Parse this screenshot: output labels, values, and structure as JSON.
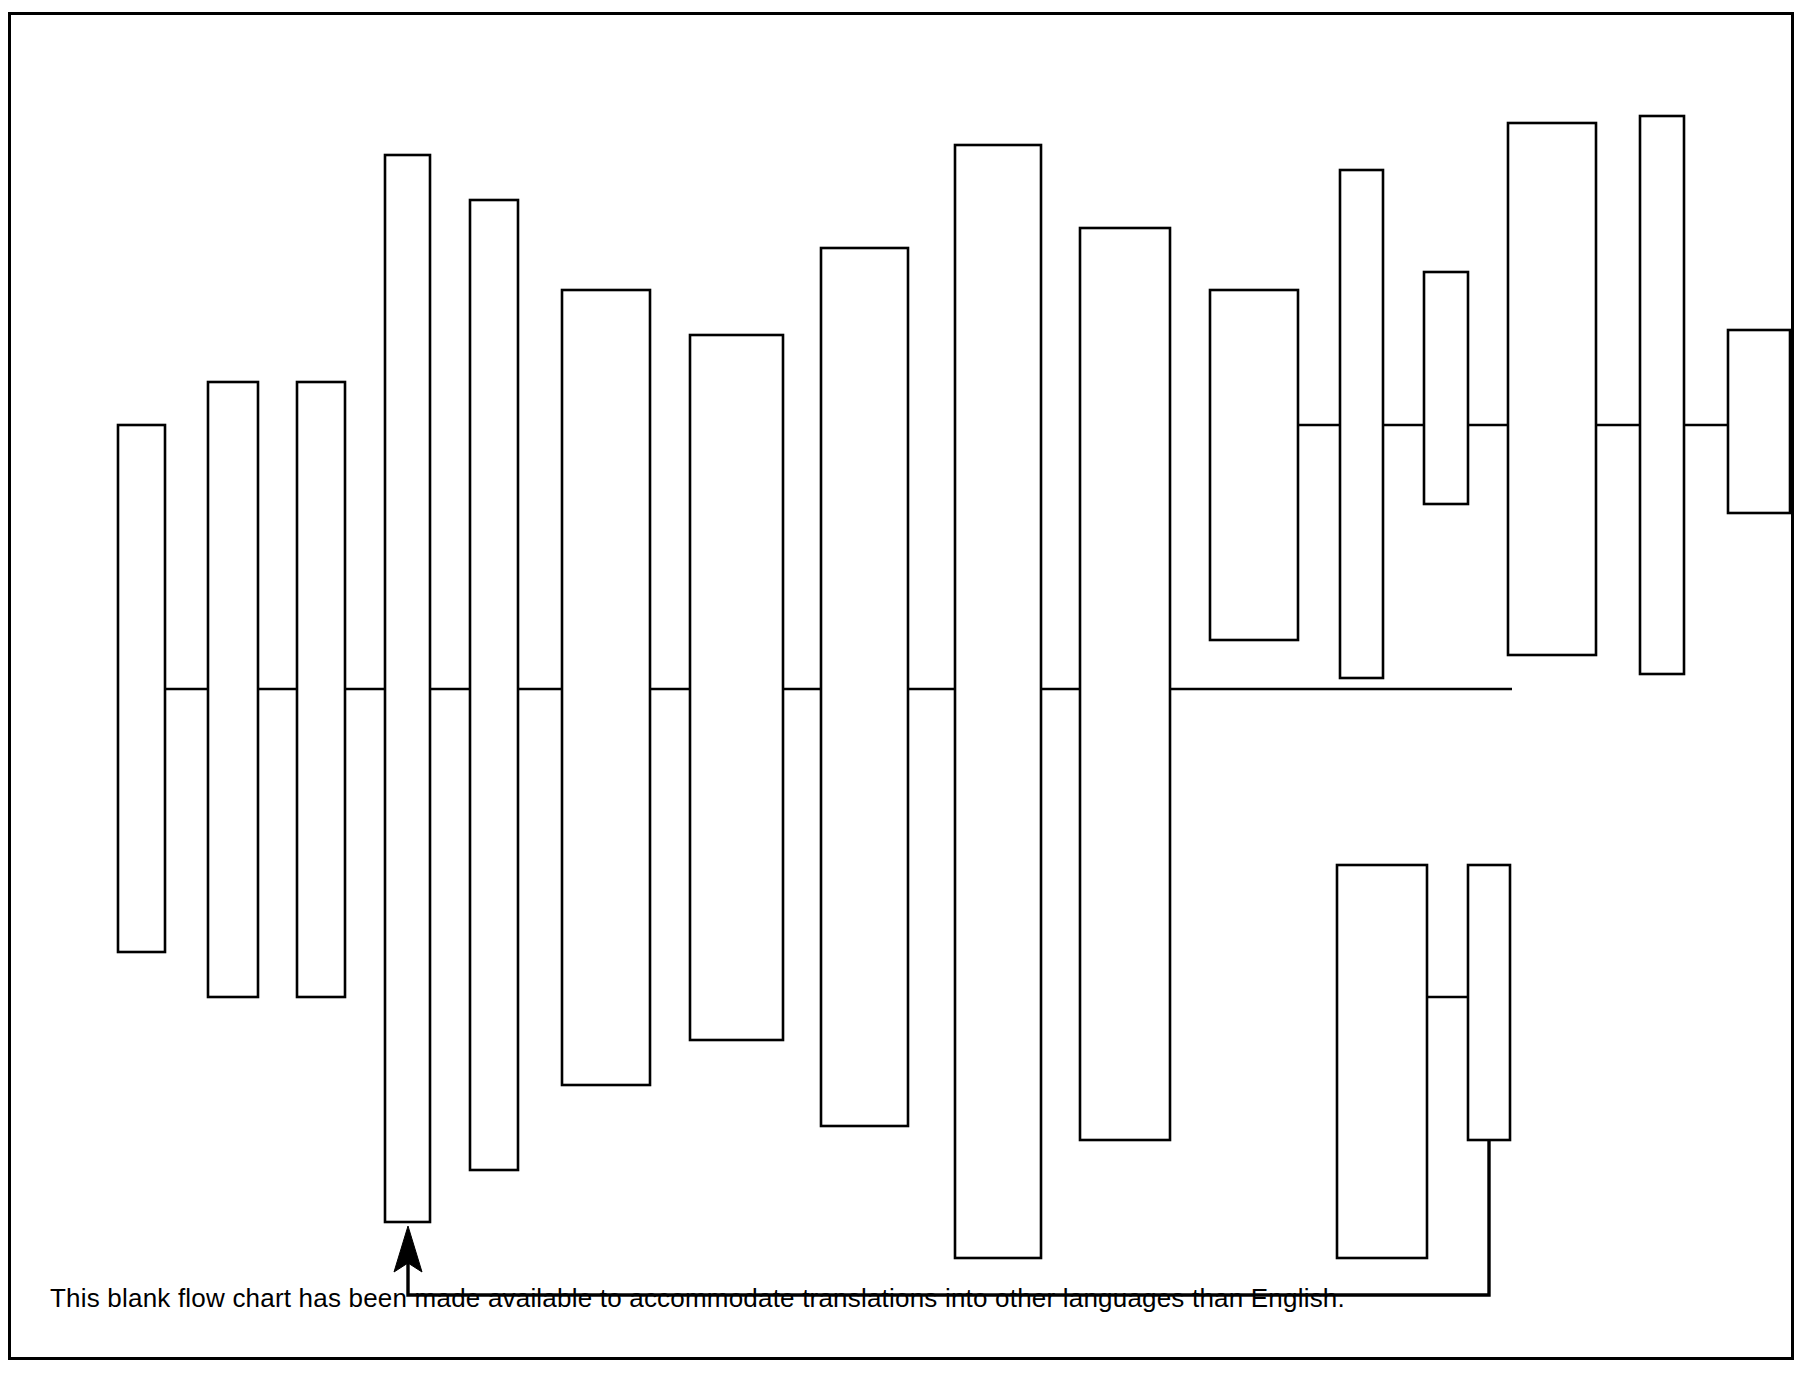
{
  "document": {
    "type": "blank-flow-chart-template",
    "caption": "This blank flow chart has been made available to accommodate translations into other languages than English.",
    "sheet": {
      "border_color": "#000000",
      "background_color": "#ffffff",
      "border_width_px": 3,
      "x": 8,
      "y": 12,
      "width": 1786,
      "height": 1348
    }
  },
  "chart_data": {
    "type": "diagram",
    "title": "",
    "subtitle": "",
    "xlabel": "",
    "ylabel": "",
    "grid": false,
    "legend": "none",
    "stroke_color": "#000000",
    "fill_color": "#ffffff",
    "stroke_width": 2.6,
    "connector_rows": [
      {
        "name": "main-spine",
        "y": 689,
        "x_start": 118,
        "x_end": 1512
      },
      {
        "name": "upper-right-spine",
        "y": 425,
        "x_start": 1298,
        "x_end": 1791
      },
      {
        "name": "lower-right-spine",
        "y": 997,
        "x_start": 1298,
        "x_end": 1470
      }
    ],
    "boxes": [
      {
        "id": 1,
        "label": "",
        "x": 118,
        "y": 425,
        "width": 47,
        "height": 527
      },
      {
        "id": 2,
        "label": "",
        "x": 208,
        "y": 382,
        "width": 50,
        "height": 615
      },
      {
        "id": 3,
        "label": "",
        "x": 297,
        "y": 382,
        "width": 48,
        "height": 615
      },
      {
        "id": 4,
        "label": "",
        "x": 385,
        "y": 155,
        "width": 45,
        "height": 1067
      },
      {
        "id": 5,
        "label": "",
        "x": 470,
        "y": 200,
        "width": 48,
        "height": 970
      },
      {
        "id": 6,
        "label": "",
        "x": 562,
        "y": 290,
        "width": 88,
        "height": 795
      },
      {
        "id": 7,
        "label": "",
        "x": 690,
        "y": 335,
        "width": 93,
        "height": 705
      },
      {
        "id": 8,
        "label": "",
        "x": 821,
        "y": 248,
        "width": 87,
        "height": 878
      },
      {
        "id": 9,
        "label": "",
        "x": 955,
        "y": 145,
        "width": 86,
        "height": 1113
      },
      {
        "id": 10,
        "label": "",
        "x": 1080,
        "y": 228,
        "width": 90,
        "height": 912
      },
      {
        "id": 11,
        "label": "",
        "x": 1210,
        "y": 290,
        "width": 88,
        "height": 350
      },
      {
        "id": 12,
        "label": "",
        "x": 1340,
        "y": 170,
        "width": 43,
        "height": 508
      },
      {
        "id": 13,
        "label": "",
        "x": 1424,
        "y": 272,
        "width": 44,
        "height": 232
      },
      {
        "id": 14,
        "label": "",
        "x": 1508,
        "y": 123,
        "width": 88,
        "height": 532
      },
      {
        "id": 15,
        "label": "",
        "x": 1640,
        "y": 116,
        "width": 44,
        "height": 558
      },
      {
        "id": 16,
        "label": "",
        "x": 1728,
        "y": 330,
        "width": 62,
        "height": 183
      },
      {
        "id": 17,
        "label": "",
        "x": 1337,
        "y": 865,
        "width": 90,
        "height": 393
      },
      {
        "id": 18,
        "label": "",
        "x": 1468,
        "y": 865,
        "width": 42,
        "height": 275
      }
    ],
    "feedback_loop": {
      "name": "return-arrow",
      "description": "Feedback line running from bottom-right box down, left along the bottom, then up with an arrowhead into the tall left box",
      "path": [
        {
          "x": 1489,
          "y": 1140
        },
        {
          "x": 1489,
          "y": 1295
        },
        {
          "x": 408,
          "y": 1295
        },
        {
          "x": 408,
          "y": 1232
        }
      ],
      "arrow": {
        "tip_x": 408,
        "tip_y": 1226,
        "direction": "up",
        "target_box_id": 4
      }
    }
  }
}
